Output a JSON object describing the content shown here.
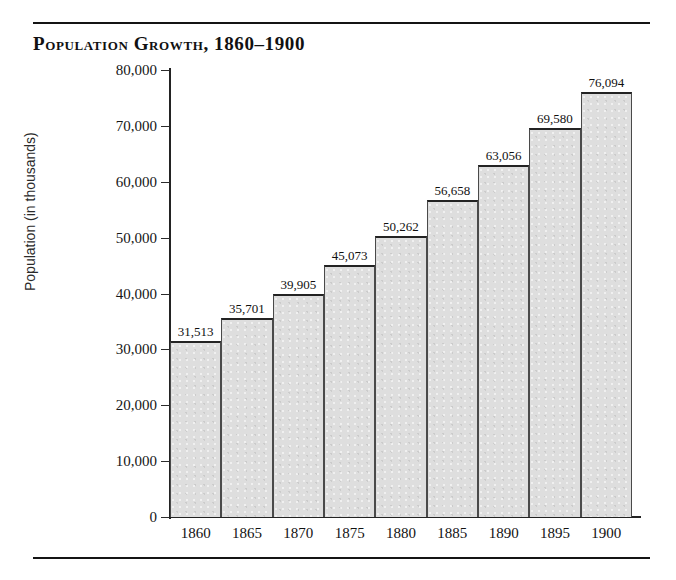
{
  "figure": {
    "title": "Population Growth, 1860–1900",
    "rules": {
      "top": true,
      "bottom": true
    }
  },
  "chart_data": {
    "type": "bar",
    "title": "Population Growth, 1860–1900",
    "xlabel": "",
    "ylabel": "Population (in thousands)",
    "categories": [
      "1860",
      "1865",
      "1870",
      "1875",
      "1880",
      "1885",
      "1890",
      "1895",
      "1900"
    ],
    "values": [
      31513,
      35701,
      39905,
      45073,
      50262,
      56658,
      63056,
      69580,
      76094
    ],
    "value_labels": [
      "31,513",
      "35,701",
      "39,905",
      "45,073",
      "50,262",
      "56,658",
      "63,056",
      "69,580",
      "76,094"
    ],
    "ylim": [
      0,
      80000
    ],
    "ytick_values": [
      0,
      10000,
      20000,
      30000,
      40000,
      50000,
      60000,
      70000,
      80000
    ],
    "ytick_labels": [
      "0",
      "10,000",
      "20,000",
      "30,000",
      "40,000",
      "50,000",
      "60,000",
      "70,000",
      "80,000"
    ],
    "grid": false,
    "legend": false,
    "bar_color": "#dedede",
    "bar_edge_color": "#232323",
    "axis_color": "#232323",
    "text_color": "#111111"
  }
}
